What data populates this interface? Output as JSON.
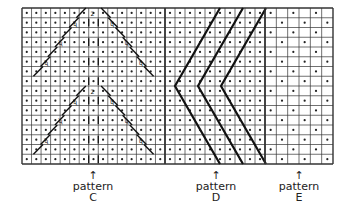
{
  "diagram": {
    "type": "knitting-chart",
    "rows": 16,
    "sections": [
      {
        "id": "C",
        "x0": 22,
        "x1": 165,
        "cols": 15
      },
      {
        "id": "D",
        "x0": 165,
        "x1": 265,
        "cols": 10
      },
      {
        "id": "E",
        "x0": 265,
        "x1": 333,
        "cols": 6
      }
    ],
    "grid": {
      "y0": 8,
      "y1": 164,
      "line_color": "#333333",
      "dot_color": "#222222",
      "stitch_color": "#111111"
    }
  },
  "labels": [
    {
      "id": "C",
      "arrow": "↑",
      "line1": "pattern",
      "line2": "C",
      "cx": 93
    },
    {
      "id": "D",
      "arrow": "↑",
      "line1": "pattern",
      "line2": "D",
      "cx": 216
    },
    {
      "id": "E",
      "arrow": "↑",
      "line1": "pattern",
      "line2": "E",
      "cx": 299
    }
  ]
}
